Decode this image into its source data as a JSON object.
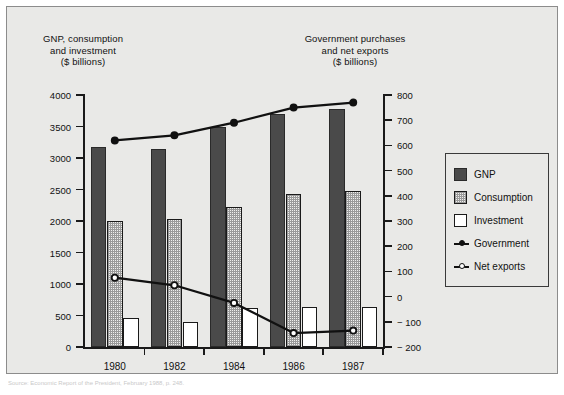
{
  "chart_data": {
    "type": "bar",
    "title": "",
    "categories": [
      "1980",
      "1982",
      "1984",
      "1986",
      "1987"
    ],
    "xlabel": "",
    "left_axis": {
      "label": "GNP, consumption\nand investment\n($ billions)",
      "ylim": [
        0,
        4000
      ],
      "ticks": [
        0,
        500,
        1000,
        1500,
        2000,
        2500,
        3000,
        3500,
        4000
      ],
      "tick_labels": [
        "0",
        "500",
        "1000",
        "1500",
        "2000",
        "2500",
        "3000",
        "3500",
        "4000"
      ]
    },
    "right_axis": {
      "label": "Government purchases\nand net exports\n($ billions)",
      "ylim": [
        -200,
        800
      ],
      "ticks": [
        -200,
        -100,
        0,
        100,
        200,
        300,
        400,
        500,
        600,
        700,
        800
      ],
      "tick_labels": [
        "− 200",
        "− 100",
        "0",
        "100",
        "200",
        "300",
        "400",
        "500",
        "600",
        "700",
        "800"
      ]
    },
    "bar_series": [
      {
        "name": "GNP",
        "axis": "left",
        "values": [
          3180,
          3150,
          3490,
          3700,
          3780
        ]
      },
      {
        "name": "Consumption",
        "axis": "left",
        "values": [
          2000,
          2035,
          2225,
          2425,
          2475
        ]
      },
      {
        "name": "Investment",
        "axis": "left",
        "values": [
          465,
          400,
          625,
          630,
          640
        ]
      }
    ],
    "line_series": [
      {
        "name": "Government",
        "axis": "right",
        "marker": "filled-circle",
        "values": [
          620,
          640,
          690,
          750,
          770
        ]
      },
      {
        "name": "Net exports",
        "axis": "right",
        "marker": "open-circle",
        "values": [
          75,
          45,
          -25,
          -145,
          -135
        ]
      }
    ],
    "grid": false,
    "legend_position": "right-outside"
  },
  "legend": {
    "items": [
      {
        "label": "GNP",
        "icon": "filled-dark-square-swatch"
      },
      {
        "label": "Consumption",
        "icon": "dotted-square-swatch"
      },
      {
        "label": "Investment",
        "icon": "white-square-swatch"
      },
      {
        "label": "Government",
        "icon": "line-filled-circle-marker"
      },
      {
        "label": "Net exports",
        "icon": "line-open-circle-marker"
      }
    ]
  },
  "source_note": "Source: Economic Report of the President, February 1988, p. 248."
}
